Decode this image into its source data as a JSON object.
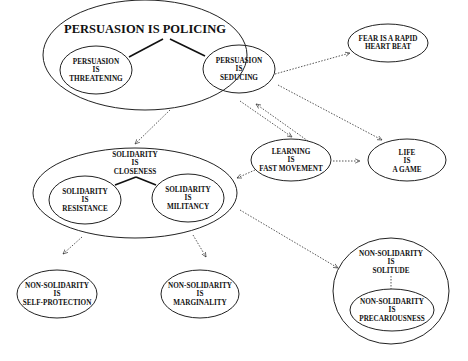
{
  "diagram": {
    "nodes": [
      {
        "id": "persuasion_policing",
        "lines": [
          "PERSUASION IS POLICING"
        ],
        "cx": 145,
        "cy": 55,
        "rx": 102,
        "ry": 55,
        "type": "group"
      },
      {
        "id": "persuasion_threatening",
        "lines": [
          "PERSUASION",
          "IS",
          "THREATENING"
        ],
        "cx": 96,
        "cy": 70,
        "rx": 36,
        "ry": 24
      },
      {
        "id": "persuasion_seducing",
        "lines": [
          "PERSUASION",
          "IS",
          "SEDUCING"
        ],
        "cx": 239,
        "cy": 69,
        "rx": 36,
        "ry": 24
      },
      {
        "id": "fear_heartbeat",
        "lines": [
          "FEAR IS A RAPID",
          "HEART BEAT"
        ],
        "cx": 388,
        "cy": 43,
        "rx": 40,
        "ry": 19
      },
      {
        "id": "learning_fast_movement",
        "lines": [
          "LEARNING",
          "IS",
          "FAST MOVEMENT"
        ],
        "cx": 291,
        "cy": 160,
        "rx": 40,
        "ry": 21
      },
      {
        "id": "life_game",
        "lines": [
          "LIFE",
          "IS",
          "A GAME"
        ],
        "cx": 407,
        "cy": 160,
        "rx": 39,
        "ry": 21
      },
      {
        "id": "solidarity_closeness",
        "lines": [
          "SOLIDARITY",
          "IS",
          "CLOSENESS"
        ],
        "cx": 135,
        "cy": 193,
        "rx": 102,
        "ry": 45,
        "type": "group"
      },
      {
        "id": "solidarity_resistance",
        "lines": [
          "SOLIDARITY",
          "IS",
          "RESISTANCE"
        ],
        "cx": 85,
        "cy": 200,
        "rx": 36,
        "ry": 24
      },
      {
        "id": "solidarity_militancy",
        "lines": [
          "SOLIDARITY",
          "IS",
          "MILITANCY"
        ],
        "cx": 188,
        "cy": 198,
        "rx": 36,
        "ry": 24
      },
      {
        "id": "nonsol_selfprotection",
        "lines": [
          "NON-SOLIDARITY",
          "IS",
          "SELF-PROTECTION"
        ],
        "cx": 57,
        "cy": 294,
        "rx": 40,
        "ry": 24
      },
      {
        "id": "nonsol_marginality",
        "lines": [
          "NON-SOLIDARITY",
          "IS",
          "MARGINALITY"
        ],
        "cx": 200,
        "cy": 294,
        "rx": 39,
        "ry": 24
      },
      {
        "id": "nonsol_solitude",
        "lines": [
          "NON-SOLIDARITY",
          "IS",
          "SOLITUDE"
        ],
        "cx": 391,
        "cy": 291,
        "rx": 58,
        "ry": 53,
        "type": "group"
      },
      {
        "id": "nonsol_precariousness",
        "lines": [
          "NON-SOLIDARITY",
          "IS",
          "PRECARIOUSNESS"
        ],
        "cx": 392,
        "cy": 310,
        "rx": 42,
        "ry": 21
      }
    ],
    "edges": [
      {
        "from": "persuasion_policing",
        "to": "persuasion_threatening",
        "style": "solid"
      },
      {
        "from": "persuasion_policing",
        "to": "persuasion_seducing",
        "style": "solid"
      },
      {
        "from": "solidarity_closeness",
        "to": "solidarity_resistance",
        "style": "solid"
      },
      {
        "from": "solidarity_closeness",
        "to": "solidarity_militancy",
        "style": "solid"
      },
      {
        "from": "persuasion_seducing",
        "to": "fear_heartbeat",
        "style": "dotted-arrow"
      },
      {
        "from": "persuasion_policing",
        "to": "learning_fast_movement",
        "style": "dotted-arrow"
      },
      {
        "from": "learning_fast_movement",
        "to": "persuasion_policing",
        "style": "dotted-arrow"
      },
      {
        "from": "persuasion_policing",
        "to": "life_game",
        "style": "dotted-arrow"
      },
      {
        "from": "learning_fast_movement",
        "to": "life_game",
        "style": "dotted-arrow"
      },
      {
        "from": "persuasion_policing",
        "to": "solidarity_closeness",
        "style": "dotted-arrow"
      },
      {
        "from": "learning_fast_movement",
        "to": "solidarity_closeness",
        "style": "dotted-arrow"
      },
      {
        "from": "solidarity_closeness",
        "to": "nonsol_selfprotection",
        "style": "dotted-arrow"
      },
      {
        "from": "solidarity_closeness",
        "to": "nonsol_marginality",
        "style": "dotted-arrow"
      },
      {
        "from": "solidarity_closeness",
        "to": "nonsol_solitude",
        "style": "dotted-arrow"
      },
      {
        "from": "nonsol_solitude",
        "to": "nonsol_precariousness",
        "style": "dotted"
      }
    ]
  },
  "labels": {
    "persuasion_policing": "PERSUASION IS POLICING",
    "persuasion_threatening": [
      "PERSUASION",
      "IS",
      "THREATENING"
    ],
    "persuasion_seducing": [
      "PERSUASION",
      "IS",
      "SEDUCING"
    ],
    "fear_heartbeat": [
      "FEAR IS A RAPID",
      "HEART BEAT"
    ],
    "learning_fast_movement": [
      "LEARNING",
      "IS",
      "FAST MOVEMENT"
    ],
    "life_game": [
      "LIFE",
      "IS",
      "A GAME"
    ],
    "solidarity_closeness": [
      "SOLIDARITY",
      "IS",
      "CLOSENESS"
    ],
    "solidarity_resistance": [
      "SOLIDARITY",
      "IS",
      "RESISTANCE"
    ],
    "solidarity_militancy": [
      "SOLIDARITY",
      "IS",
      "MILITANCY"
    ],
    "nonsol_selfprotection": [
      "NON-SOLIDARITY",
      "IS",
      "SELF-PROTECTION"
    ],
    "nonsol_marginality": [
      "NON-SOLIDARITY",
      "IS",
      "MARGINALITY"
    ],
    "nonsol_solitude": [
      "NON-SOLIDARITY",
      "IS",
      "SOLITUDE"
    ],
    "nonsol_precariousness": [
      "NON-SOLIDARITY",
      "IS",
      "PRECARIOUSNESS"
    ]
  }
}
